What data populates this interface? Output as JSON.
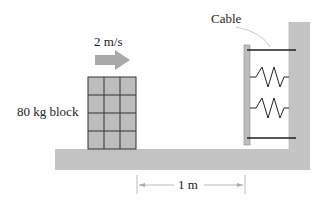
{
  "labels": {
    "velocity": "2 m/s",
    "block": "80 kg block",
    "cable": "Cable",
    "distance": "1 m"
  },
  "colors": {
    "fill": "#bdbdbd",
    "line": "#222222",
    "dim": "#999999"
  }
}
